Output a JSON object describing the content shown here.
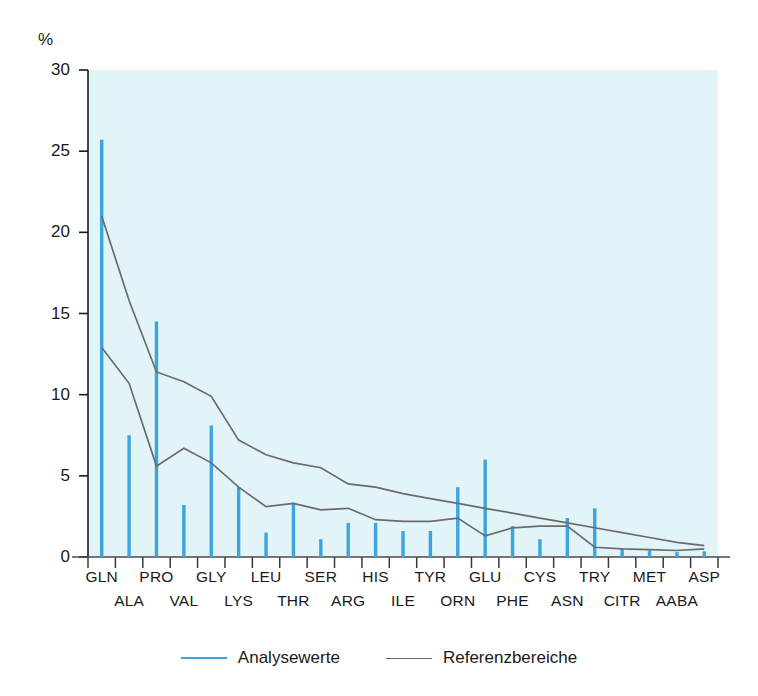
{
  "chart_data": {
    "type": "bar",
    "title": "",
    "subtitle": "",
    "xlabel": "",
    "ylabel": "%",
    "ylim": [
      0,
      30
    ],
    "yticks": [
      0,
      5,
      10,
      15,
      20,
      25,
      30
    ],
    "ytick_labels": [
      "0",
      "5",
      "10",
      "15",
      "20",
      "25",
      "30"
    ],
    "grid": false,
    "legend_position": "bottom-center",
    "plot_background": "#e2f4f8",
    "categories": [
      "GLN",
      "ALA",
      "PRO",
      "VAL",
      "GLY",
      "LYS",
      "LEU",
      "THR",
      "SER",
      "ARG",
      "HIS",
      "ILE",
      "TYR",
      "ORN",
      "GLU",
      "PHE",
      "CYS",
      "ASN",
      "TRY",
      "CITR",
      "MET",
      "AABA",
      "ASP"
    ],
    "category_rows": {
      "top_row": [
        "GLN",
        "PRO",
        "GLY",
        "LEU",
        "SER",
        "HIS",
        "TYR",
        "GLU",
        "CYS",
        "TRY",
        "MET",
        "ASP"
      ],
      "bottom_row": [
        "ALA",
        "VAL",
        "LYS",
        "THR",
        "ARG",
        "ILE",
        "ORN",
        "PHE",
        "ASN",
        "CITR",
        "AABA"
      ]
    },
    "series": [
      {
        "name": "Analysewerte",
        "type": "bar",
        "color": "#3aa5de",
        "values": [
          25.7,
          7.5,
          14.5,
          3.2,
          8.1,
          4.3,
          1.5,
          3.3,
          1.1,
          2.1,
          2.1,
          1.6,
          1.6,
          4.3,
          6.0,
          1.9,
          1.1,
          2.4,
          3.0,
          0.5,
          0.4,
          0.3,
          0.35
        ]
      },
      {
        "name": "Referenzbereiche oben",
        "type": "line",
        "color": "#6b6b6b",
        "values": [
          21.0,
          15.8,
          11.4,
          10.8,
          9.9,
          7.2,
          6.3,
          5.8,
          5.5,
          4.5,
          4.3,
          3.9,
          3.6,
          3.3,
          3.0,
          2.7,
          2.4,
          2.1,
          1.8,
          1.5,
          1.2,
          0.9,
          0.7
        ]
      },
      {
        "name": "Referenzbereiche unten",
        "type": "line",
        "color": "#6b6b6b",
        "values": [
          12.9,
          10.7,
          5.6,
          6.7,
          5.8,
          4.3,
          3.1,
          3.3,
          2.9,
          3.0,
          2.3,
          2.2,
          2.2,
          2.4,
          1.3,
          1.8,
          1.9,
          1.9,
          0.6,
          0.5,
          0.45,
          0.4,
          0.5
        ]
      }
    ]
  },
  "legend": {
    "items": [
      {
        "label": "Analysewerte",
        "color": "#3aa5de",
        "style": "analysis"
      },
      {
        "label": "Referenzbereiche",
        "color": "#6b6b6b",
        "style": "reference"
      }
    ]
  }
}
